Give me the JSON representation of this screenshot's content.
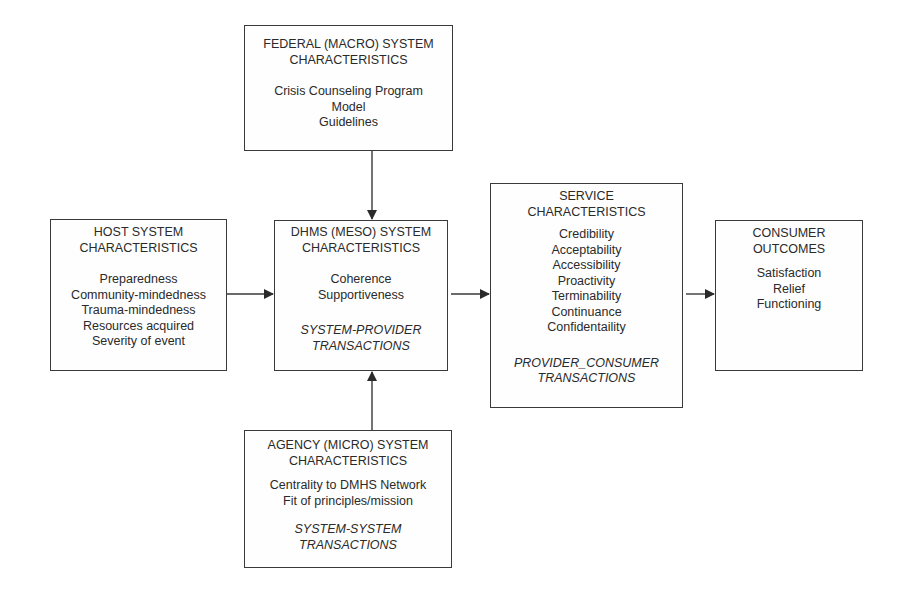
{
  "diagram": {
    "federal": {
      "title": [
        "FEDERAL (MACRO) SYSTEM",
        "CHARACTERISTICS"
      ],
      "items": [
        "Crisis Counseling Program",
        "Model",
        "Guidelines"
      ]
    },
    "host": {
      "title": [
        "HOST SYSTEM",
        "CHARACTERISTICS"
      ],
      "items": [
        "Preparedness",
        "Community-mindedness",
        "Trauma-mindedness",
        "Resources acquired",
        "Severity of event"
      ]
    },
    "dhms": {
      "title": [
        "DHMS (MESO) SYSTEM",
        "CHARACTERISTICS"
      ],
      "items": [
        "Coherence",
        "Supportiveness"
      ],
      "note": [
        "SYSTEM-PROVIDER",
        "TRANSACTIONS"
      ]
    },
    "service": {
      "title": [
        "SERVICE",
        "CHARACTERISTICS"
      ],
      "items": [
        "Credibility",
        "Acceptability",
        "Accessibility",
        "Proactivity",
        "Terminability",
        "Continuance",
        "Confidentaility"
      ],
      "note": [
        "PROVIDER_CONSUMER",
        "TRANSACTIONS"
      ]
    },
    "consumer": {
      "title": [
        "CONSUMER",
        "OUTCOMES"
      ],
      "items": [
        "Satisfaction",
        "Relief",
        "Functioning"
      ]
    },
    "agency": {
      "title": [
        "AGENCY (MICRO) SYSTEM",
        "CHARACTERISTICS"
      ],
      "items": [
        "Centrality to DMHS Network",
        "Fit of principles/mission"
      ],
      "note": [
        "SYSTEM-SYSTEM",
        "TRANSACTIONS"
      ]
    },
    "edges": [
      {
        "from": "federal",
        "to": "dhms"
      },
      {
        "from": "agency",
        "to": "dhms"
      },
      {
        "from": "host",
        "to": "dhms"
      },
      {
        "from": "dhms",
        "to": "service"
      },
      {
        "from": "service",
        "to": "consumer"
      }
    ],
    "colors": {
      "line": "#3a3a3a",
      "text": "#2a2a2a",
      "background": "#ffffff"
    }
  }
}
